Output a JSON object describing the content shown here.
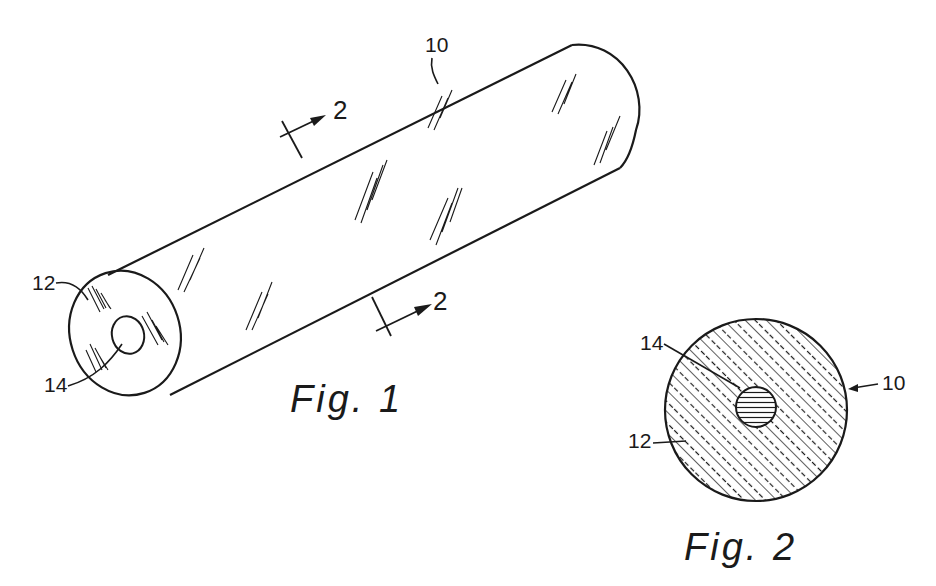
{
  "colors": {
    "ink": "#1a1a1a",
    "paper": "#ffffff"
  },
  "figures": [
    {
      "id": "fig1",
      "caption": "Fig. 1",
      "view": "isometric hollow cylinder",
      "reference_numerals": {
        "body": "10",
        "end_face": "12",
        "bore": "14"
      },
      "section_markers": [
        "2",
        "2"
      ]
    },
    {
      "id": "fig2",
      "caption": "Fig. 2",
      "view": "cross-section 2-2",
      "reference_numerals": {
        "body": "10",
        "annulus": "12",
        "core": "14"
      }
    }
  ]
}
